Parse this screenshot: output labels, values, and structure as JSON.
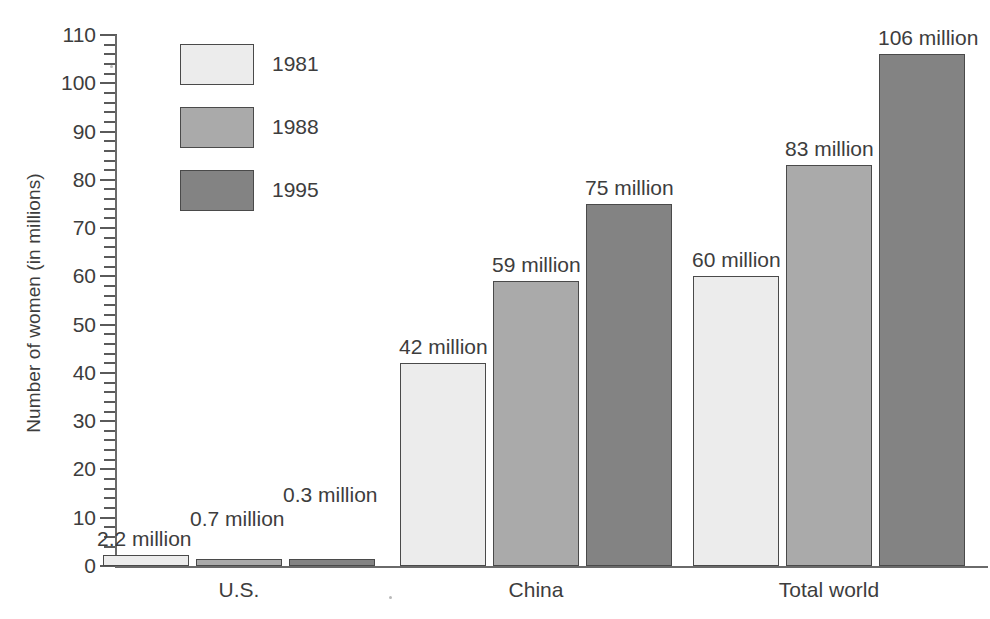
{
  "chart_data": {
    "type": "bar",
    "title": "",
    "xlabel": "",
    "ylabel": "Number of women (in millions)",
    "ylim": [
      0,
      110
    ],
    "y_tick_step": 10,
    "y_minor_step": 2,
    "grid": false,
    "legend_position": "top-left-inside",
    "categories": [
      "U.S.",
      "China",
      "Total world"
    ],
    "series": [
      {
        "name": "1981",
        "color": "#ececec",
        "values": [
          2.2,
          42,
          60
        ],
        "value_labels": [
          "2.2 million",
          "42 million",
          "60 million"
        ]
      },
      {
        "name": "1988",
        "color": "#aaaaaa",
        "values": [
          0.7,
          59,
          83
        ],
        "value_labels": [
          "0.7 million",
          "59 million",
          "83 million"
        ]
      },
      {
        "name": "1995",
        "color": "#838383",
        "values": [
          0.3,
          75,
          106
        ],
        "value_labels": [
          "0.3 million",
          "75 million",
          "106 million"
        ]
      }
    ],
    "y_tick_labels": [
      "0",
      "10",
      "20",
      "30",
      "40",
      "50",
      "60",
      "70",
      "80",
      "90",
      "100",
      "110"
    ]
  },
  "axis": {
    "y_title": "Number of women (in millions)",
    "y_ticks": [
      {
        "value": 110,
        "label": "110"
      },
      {
        "value": 100,
        "label": "100"
      },
      {
        "value": 90,
        "label": "90"
      },
      {
        "value": 80,
        "label": "80"
      },
      {
        "value": 70,
        "label": "70"
      },
      {
        "value": 60,
        "label": "60"
      },
      {
        "value": 50,
        "label": "50"
      },
      {
        "value": 40,
        "label": "40"
      },
      {
        "value": 30,
        "label": "30"
      },
      {
        "value": 20,
        "label": "20"
      },
      {
        "value": 10,
        "label": "10"
      },
      {
        "value": 0,
        "label": "0"
      }
    ]
  },
  "legend": {
    "items": [
      {
        "label": "1981",
        "color": "#ececec"
      },
      {
        "label": "1988",
        "color": "#aaaaaa"
      },
      {
        "label": "1995",
        "color": "#838383"
      }
    ]
  },
  "categories": [
    {
      "label": "U.S."
    },
    {
      "label": "China"
    },
    {
      "label": "Total world"
    }
  ],
  "bars": [
    {
      "group": "U.S.",
      "series": "1981",
      "value": 2.2,
      "label": "2.2 million",
      "color": "#ececec"
    },
    {
      "group": "U.S.",
      "series": "1988",
      "value": 0.7,
      "label": "0.7 million",
      "color": "#aaaaaa"
    },
    {
      "group": "U.S.",
      "series": "1995",
      "value": 0.3,
      "label": "0.3 million",
      "color": "#838383"
    },
    {
      "group": "China",
      "series": "1981",
      "value": 42,
      "label": "42 million",
      "color": "#ececec"
    },
    {
      "group": "China",
      "series": "1988",
      "value": 59,
      "label": "59 million",
      "color": "#aaaaaa"
    },
    {
      "group": "China",
      "series": "1995",
      "value": 75,
      "label": "75 million",
      "color": "#838383"
    },
    {
      "group": "Total world",
      "series": "1981",
      "value": 60,
      "label": "60 million",
      "color": "#ececec"
    },
    {
      "group": "Total world",
      "series": "1988",
      "value": 83,
      "label": "83 million",
      "color": "#aaaaaa"
    },
    {
      "group": "Total world",
      "series": "1995",
      "value": 106,
      "label": "106 million",
      "color": "#838383"
    }
  ]
}
